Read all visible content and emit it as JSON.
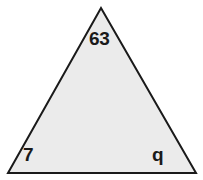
{
  "figure": {
    "type": "triangle-diagram",
    "background_color": "#ffffff",
    "shape": {
      "name": "triangle",
      "fill_color": "#ebebeb",
      "stroke_color": "#1a1a1a",
      "stroke_width": 2,
      "vertices": {
        "apex": {
          "x": 101,
          "y": 8
        },
        "bottom_left": {
          "x": 8,
          "y": 173
        },
        "bottom_right": {
          "x": 196,
          "y": 173
        }
      }
    },
    "labels": {
      "apex": "63",
      "bottom_left": "7",
      "bottom_right": "q"
    }
  }
}
